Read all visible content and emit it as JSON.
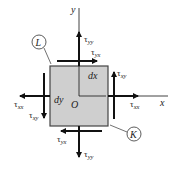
{
  "diagram": {
    "type": "stress-element",
    "axes": {
      "x_label": "x",
      "y_label": "y",
      "origin_label": "O"
    },
    "element": {
      "width_label": "dx",
      "height_label": "dy",
      "fill": "#cfcfcf",
      "stroke": "#444444"
    },
    "callouts": [
      {
        "id": "L",
        "label": "L"
      },
      {
        "id": "K",
        "label": "K"
      }
    ],
    "stresses": {
      "top_normal": {
        "symbol": "τ",
        "sub": "yy"
      },
      "top_shear": {
        "symbol": "τ",
        "sub": "yx"
      },
      "right_normal": {
        "symbol": "τ",
        "sub": "xx"
      },
      "right_shear": {
        "symbol": "τ",
        "sub": "xy"
      },
      "left_normal": {
        "symbol": "τ",
        "sub": "xx"
      },
      "left_shear": {
        "symbol": "τ",
        "sub": "xy"
      },
      "bottom_normal": {
        "symbol": "τ",
        "sub": "yy"
      },
      "bottom_shear": {
        "symbol": "τ",
        "sub": "yx"
      }
    },
    "colors": {
      "line": "#111111",
      "text": "#222222"
    }
  }
}
